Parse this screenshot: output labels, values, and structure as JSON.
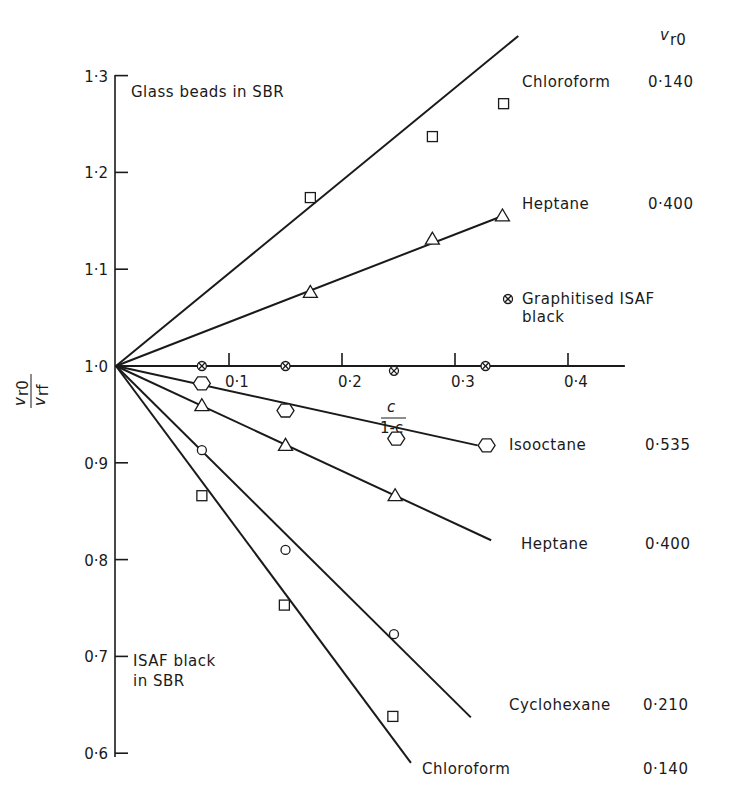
{
  "chart_data": {
    "type": "line",
    "title": "",
    "xlabel": "c / (1-c)",
    "xlabel_num": "c",
    "xlabel_den": "1-c",
    "ylabel": "v_r0 / v_rf",
    "ylabel_num": "v",
    "ylabel_num_sub": "r0",
    "ylabel_den": "v",
    "ylabel_den_sub": "rf",
    "xlim": [
      0,
      0.45
    ],
    "ylim": [
      0.6,
      1.3
    ],
    "x_ticks": [
      0.1,
      0.2,
      0.3,
      0.4
    ],
    "x_tick_labels": [
      "0·1",
      "0·2",
      "0·3",
      "0·4"
    ],
    "y_ticks": [
      0.6,
      0.7,
      0.8,
      0.9,
      1.0,
      1.1,
      1.2,
      1.3
    ],
    "y_tick_labels": [
      "0·6",
      "0·7",
      "0·8",
      "0·9",
      "1·0",
      "1·1",
      "1·2",
      "1·3"
    ],
    "grid": false,
    "column_header": "v",
    "column_header_sub": "r0",
    "annotations": {
      "top": "Glass beads in SBR",
      "bottom_line1": "ISAF black",
      "bottom_line2": "in SBR"
    },
    "series": [
      {
        "name": "Chloroform",
        "group": "Glass beads in SBR",
        "vr0": "0·140",
        "marker": "square",
        "x": [
          0.172,
          0.28,
          0.343
        ],
        "y": [
          1.174,
          1.237,
          1.271
        ],
        "fit_line": [
          [
            0,
            1.0
          ],
          [
            0.356,
            1.341
          ]
        ]
      },
      {
        "name": "Heptane",
        "group": "Glass beads in SBR",
        "vr0": "0·400",
        "marker": "triangle",
        "x": [
          0.172,
          0.28,
          0.342
        ],
        "y": [
          1.076,
          1.131,
          1.155
        ],
        "fit_line": [
          [
            0,
            1.0
          ],
          [
            0.342,
            1.155
          ]
        ]
      },
      {
        "name": "Graphitised ISAF black",
        "group": "",
        "vr0": "",
        "marker": "circle-cross",
        "x": [
          0.076,
          0.15,
          0.246,
          0.327
        ],
        "y": [
          1.0,
          1.0,
          0.995,
          1.0
        ],
        "fit_line": [
          [
            0,
            1.0
          ],
          [
            0.45,
            1.0
          ]
        ]
      },
      {
        "name": "Isooctane",
        "group": "ISAF black in SBR",
        "vr0": "0·535",
        "marker": "hexagon",
        "x": [
          0.076,
          0.15,
          0.248,
          0.328
        ],
        "y": [
          0.982,
          0.954,
          0.925,
          0.918
        ],
        "fit_line": [
          [
            0,
            1.0
          ],
          [
            0.32,
            0.918
          ]
        ]
      },
      {
        "name": "Heptane",
        "group": "ISAF black in SBR",
        "vr0": "0·400",
        "marker": "triangle",
        "x": [
          0.076,
          0.15,
          0.247
        ],
        "y": [
          0.959,
          0.918,
          0.866
        ],
        "fit_line": [
          [
            0,
            1.0
          ],
          [
            0.332,
            0.82
          ]
        ]
      },
      {
        "name": "Cyclohexane",
        "group": "ISAF black in SBR",
        "vr0": "0·210",
        "marker": "circle",
        "x": [
          0.076,
          0.15,
          0.246
        ],
        "y": [
          0.913,
          0.81,
          0.723
        ],
        "fit_line": [
          [
            0,
            1.0
          ],
          [
            0.314,
            0.637
          ]
        ]
      },
      {
        "name": "Chloroform",
        "group": "ISAF black in SBR",
        "vr0": "0·140",
        "marker": "square",
        "x": [
          0.076,
          0.149,
          0.245
        ],
        "y": [
          0.866,
          0.753,
          0.638
        ],
        "fit_line": [
          [
            0,
            1.0
          ],
          [
            0.261,
            0.59
          ]
        ]
      }
    ]
  }
}
